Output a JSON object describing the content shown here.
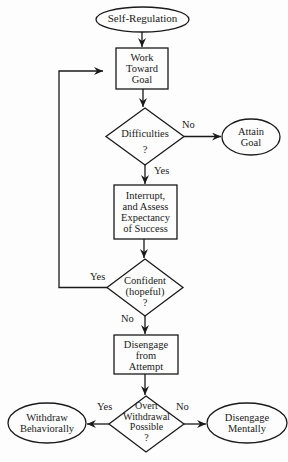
{
  "diagram": {
    "nodes": {
      "start": {
        "label": "Self-Regulation",
        "shape": "ellipse"
      },
      "work": {
        "line1": "Work",
        "line2": "Toward",
        "line3": "Goal",
        "shape": "rect"
      },
      "difficulties": {
        "line1": "Difficulties",
        "line2": "?",
        "shape": "diamond"
      },
      "attain": {
        "line1": "Attain",
        "line2": "Goal",
        "shape": "ellipse"
      },
      "interrupt": {
        "line1": "Interrupt,",
        "line2": "and Assess",
        "line3": "Expectancy",
        "line4": "of Success",
        "shape": "rect"
      },
      "confident": {
        "line1": "Confident",
        "line2": "(hopeful)",
        "line3": "?",
        "shape": "diamond"
      },
      "disengage_attempt": {
        "line1": "Disengage",
        "line2": "from",
        "line3": "Attempt",
        "shape": "rect"
      },
      "overt": {
        "line1": "Overt",
        "line2": "Withdrawal",
        "line3": "Possible",
        "line4": "?",
        "shape": "diamond"
      },
      "withdraw": {
        "line1": "Withdraw",
        "line2": "Behaviorally",
        "shape": "ellipse"
      },
      "disengage_mentally": {
        "line1": "Disengage",
        "line2": "Mentally",
        "shape": "ellipse"
      }
    },
    "edge_labels": {
      "difficulties_no": "No",
      "difficulties_yes": "Yes",
      "confident_yes": "Yes",
      "confident_no": "No",
      "overt_yes": "Yes",
      "overt_no": "No"
    },
    "edges": [
      {
        "from": "start",
        "to": "work"
      },
      {
        "from": "work",
        "to": "difficulties"
      },
      {
        "from": "difficulties",
        "to": "attain",
        "label": "No"
      },
      {
        "from": "difficulties",
        "to": "interrupt",
        "label": "Yes"
      },
      {
        "from": "interrupt",
        "to": "confident"
      },
      {
        "from": "confident",
        "to": "work",
        "label": "Yes"
      },
      {
        "from": "confident",
        "to": "disengage_attempt",
        "label": "No"
      },
      {
        "from": "disengage_attempt",
        "to": "overt"
      },
      {
        "from": "overt",
        "to": "withdraw",
        "label": "Yes"
      },
      {
        "from": "overt",
        "to": "disengage_mentally",
        "label": "No"
      }
    ]
  }
}
